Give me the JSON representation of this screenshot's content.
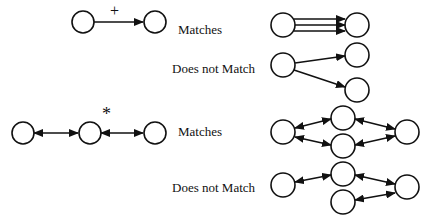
{
  "figure": {
    "rows": [
      {
        "operator": "+",
        "labels": {
          "matches": "Matches",
          "no_match": "Does not Match"
        }
      },
      {
        "operator": "*",
        "labels": {
          "matches": "Matches",
          "no_match": "Does not Match"
        }
      }
    ],
    "colors": {
      "stroke": "#111111",
      "background": "#ffffff"
    }
  }
}
